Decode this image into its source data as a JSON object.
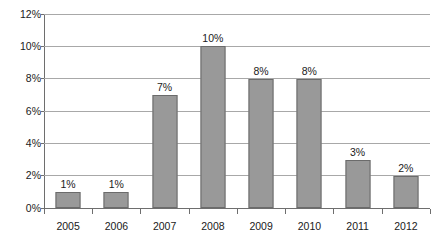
{
  "chart_data": {
    "type": "bar",
    "title": "",
    "subtitle": "",
    "xlabel": "",
    "ylabel": "",
    "categories": [
      "2005",
      "2006",
      "2007",
      "2008",
      "2009",
      "2010",
      "2011",
      "2012"
    ],
    "values": [
      1,
      2,
      7,
      10,
      8,
      8,
      3,
      2
    ],
    "value_labels": [
      "1%",
      "1%",
      "7%",
      "10%",
      "8%",
      "8%",
      "3%",
      "2%"
    ],
    "ylim": [
      0,
      12
    ],
    "ytick_values": [
      0,
      2,
      4,
      6,
      8,
      10,
      12
    ],
    "ytick_labels": [
      "0%",
      "2%",
      "4%",
      "6%",
      "8%",
      "10%",
      "12%"
    ],
    "grid": true,
    "legend": false,
    "legend_position": "none",
    "series": [
      {
        "name": "",
        "values": [
          1,
          1,
          7,
          10,
          8,
          8,
          3,
          2
        ]
      }
    ]
  },
  "style": {
    "bar_fill": "#999999",
    "bar_border": "#6b6b6b",
    "gridline_color": "#a8a8a8",
    "axis_color": "#6e6e6e",
    "text_color": "#1a1a1a",
    "background": "#ffffff"
  }
}
